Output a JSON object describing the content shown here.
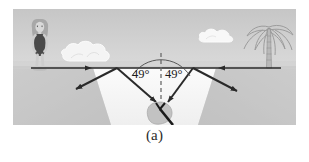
{
  "figure": {
    "caption": "(a)",
    "kind": "optics-ray-diagram",
    "scene_description": "light rays refracting at a lake surface toward an object on the lake bottom"
  },
  "labels": {
    "angle_left": "49°",
    "angle_right": "49°"
  },
  "objects": {
    "person": "swimmer-figure",
    "tree": "palm-tree",
    "cloud_left": "cloud",
    "cloud_right": "cloud",
    "bottom_object": "submerged-rock-with-stick",
    "normal_line": "dashed-normal",
    "water_surface": "water-surface-line"
  },
  "colors": {
    "sky_top": "#c9c9c9",
    "sky_bottom": "#e4e4e4",
    "sand": "#c4c4c4",
    "water": "#f2f2f2",
    "ray": "#2a2a2a",
    "text": "#1d1d1d",
    "caption": "#2b2b2b"
  },
  "geometry": {
    "surface_y": 68,
    "normal_x": 148,
    "object_x": 148,
    "object_y": 108
  }
}
